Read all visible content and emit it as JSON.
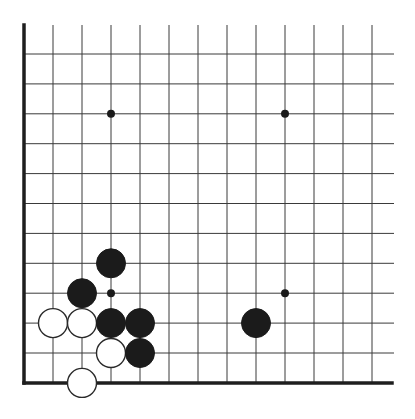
{
  "diagram": {
    "type": "go-board-partial",
    "view": "lower-left corner",
    "grid": {
      "columns": 13,
      "rows": 12,
      "x0": 24,
      "dx": 29,
      "y0": 54,
      "dy": 29.9,
      "line_top": 25,
      "line_right": 394,
      "left_edge": true,
      "bottom_edge": true
    },
    "colors": {
      "line": "#3a3a3a",
      "edge": "#1e1e1e",
      "black_stone": "#1b1b1b",
      "white_stone_fill": "#ffffff",
      "white_stone_outline": "#2a2a2a",
      "background": "#ffffff"
    },
    "stone_radius": 14.5,
    "star_points": [
      {
        "col": 3,
        "row": 2
      },
      {
        "col": 9,
        "row": 2
      },
      {
        "col": 3,
        "row": 8
      },
      {
        "col": 9,
        "row": 8
      }
    ],
    "stones": [
      {
        "color": "black",
        "col": 3,
        "row": 7
      },
      {
        "color": "black",
        "col": 2,
        "row": 8
      },
      {
        "color": "white",
        "col": 1,
        "row": 9
      },
      {
        "color": "white",
        "col": 2,
        "row": 9
      },
      {
        "color": "black",
        "col": 3,
        "row": 9
      },
      {
        "color": "black",
        "col": 4,
        "row": 9
      },
      {
        "color": "white",
        "col": 3,
        "row": 10
      },
      {
        "color": "black",
        "col": 4,
        "row": 10
      },
      {
        "color": "white",
        "col": 2,
        "row": 11
      },
      {
        "color": "black",
        "col": 8,
        "row": 9
      }
    ]
  }
}
